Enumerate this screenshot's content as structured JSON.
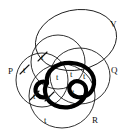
{
  "diagram": {
    "type": "venn-diagram",
    "title": "",
    "background_color": "#ffffff",
    "line_color": "#1a1a1a",
    "highlight_color": "#000000",
    "set_labels": [
      {
        "name": "P",
        "text": "P",
        "x": 8,
        "y": 71
      },
      {
        "name": "Q",
        "text": "Q",
        "x": 113,
        "y": 70
      },
      {
        "name": "R",
        "text": "R",
        "x": 94,
        "y": 120
      },
      {
        "name": "V",
        "text": "V",
        "x": 112,
        "y": 24
      }
    ],
    "sets": [
      {
        "name": "P",
        "shape": "ellipse",
        "cx": 42,
        "cy": 80,
        "rx": 26,
        "ry": 27,
        "rotation": 0
      },
      {
        "name": "Q",
        "shape": "ellipse",
        "cx": 80,
        "cy": 76,
        "rx": 30,
        "ry": 28,
        "rotation": 0
      },
      {
        "name": "R",
        "shape": "ellipse",
        "cx": 62,
        "cy": 96,
        "rx": 33,
        "ry": 32,
        "rotation": 0
      },
      {
        "name": "S",
        "shape": "ellipse",
        "cx": 58,
        "cy": 62,
        "rx": 27,
        "ry": 27,
        "rotation": 0
      },
      {
        "name": "V",
        "shape": "ellipse",
        "cx": 76,
        "cy": 40,
        "rx": 41,
        "ry": 30,
        "rotation": -12
      }
    ],
    "cells": [
      {
        "name": "cell-p-only",
        "label": "t",
        "negated": true,
        "x": 26,
        "y": 70
      },
      {
        "name": "cell-p-s",
        "label": "t",
        "negated": true,
        "x": 44,
        "y": 57
      },
      {
        "name": "cell-p-r",
        "label": "t",
        "negated": true,
        "x": 36,
        "y": 96
      },
      {
        "name": "cell-p-r-s",
        "label": "t",
        "negated": true,
        "x": 51,
        "y": 97
      },
      {
        "name": "cell-s-v",
        "label": "t",
        "negated": false,
        "x": 59,
        "y": 77
      },
      {
        "name": "cell-q-s-v",
        "label": "t",
        "negated": false,
        "x": 73,
        "y": 74
      },
      {
        "name": "cell-q-v",
        "label": "t",
        "negated": false,
        "x": 86,
        "y": 76
      },
      {
        "name": "cell-core",
        "label": "t",
        "negated": false,
        "x": 75,
        "y": 92
      },
      {
        "name": "cell-q-r",
        "label": "t",
        "negated": false,
        "x": 73,
        "y": 106
      },
      {
        "name": "cell-r-only",
        "label": "t",
        "negated": false,
        "x": 47,
        "y": 120
      }
    ]
  }
}
